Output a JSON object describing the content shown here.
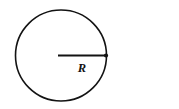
{
  "figure": {
    "name": "circle-with-radius-diagram",
    "background_color": "#ffffff",
    "stroke_color": "#131313"
  },
  "circle": {
    "name": "circle-outline",
    "center_x": 61,
    "center_y": 55.5,
    "radius": 45.5,
    "stroke_width": 1.6,
    "fill": "none",
    "stroke_color": "#131313"
  },
  "radius_segment": {
    "name": "radius-line",
    "start_x": 58,
    "start_y": 55.5,
    "end_x": 106.5,
    "end_y": 55.5,
    "stroke_width": 2.0,
    "stroke_color": "#131313"
  },
  "endpoint_marker": {
    "name": "radius-endpoint-dot",
    "cx": 106,
    "cy": 55.5,
    "r": 2.1,
    "fill": "#131313"
  },
  "labels": {
    "radius": {
      "text": "R",
      "x": 82,
      "y": 72,
      "style": "bold-italic-serif"
    }
  }
}
